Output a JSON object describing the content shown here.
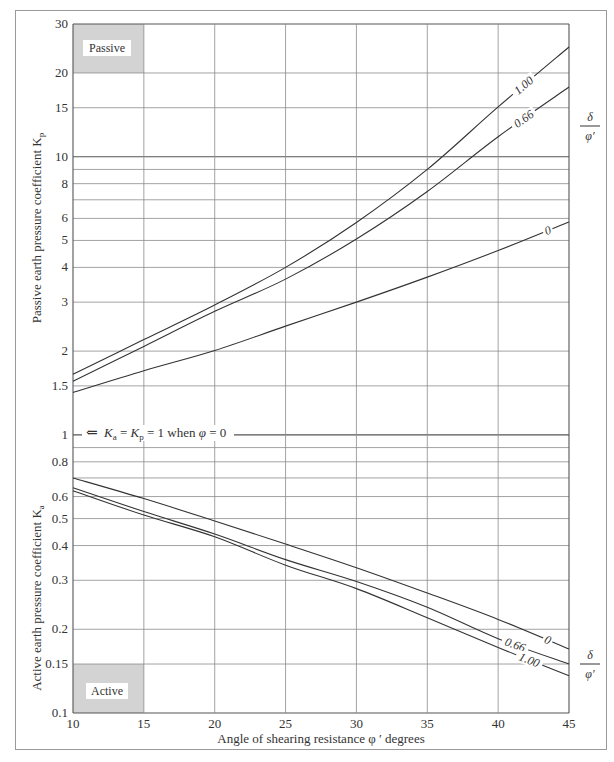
{
  "chart_data": {
    "type": "line",
    "title": "",
    "xlabel": "Angle of shearing resistance φ ′  degrees",
    "ylabel_passive": "Passive earth pressure coefficient K",
    "ylabel_passive_sub": "p",
    "ylabel_active": "Active earth pressure coefficient K",
    "ylabel_active_sub": "a",
    "x_scale": "linear",
    "y_scale": "log",
    "xlim": [
      10,
      45
    ],
    "ylim": [
      0.1,
      30
    ],
    "grid": true,
    "x_ticks": [
      10,
      15,
      20,
      25,
      30,
      35,
      40,
      45
    ],
    "y_gridlines": [
      30,
      20,
      15,
      10,
      9,
      8,
      7,
      6,
      5,
      4,
      3,
      2,
      1.5,
      1,
      0.9,
      0.8,
      0.7,
      0.6,
      0.5,
      0.4,
      0.3,
      0.2,
      0.15,
      0.1
    ],
    "y_tick_labels": [
      {
        "value": 30,
        "label": "30"
      },
      {
        "value": 20,
        "label": "20"
      },
      {
        "value": 15,
        "label": "15"
      },
      {
        "value": 10,
        "label": "10"
      },
      {
        "value": 8,
        "label": "8"
      },
      {
        "value": 6,
        "label": "6"
      },
      {
        "value": 5,
        "label": "5"
      },
      {
        "value": 4,
        "label": "4"
      },
      {
        "value": 3,
        "label": "3"
      },
      {
        "value": 2,
        "label": "2"
      },
      {
        "value": 1.5,
        "label": "1.5"
      },
      {
        "value": 1,
        "label": "1"
      },
      {
        "value": 0.8,
        "label": "0.8"
      },
      {
        "value": 0.6,
        "label": "0.6"
      },
      {
        "value": 0.5,
        "label": "0.5"
      },
      {
        "value": 0.4,
        "label": "0.4"
      },
      {
        "value": 0.3,
        "label": "0.3"
      },
      {
        "value": 0.2,
        "label": "0.2"
      },
      {
        "value": 0.15,
        "label": "0.15"
      },
      {
        "value": 0.1,
        "label": "0.1"
      }
    ],
    "x": [
      10,
      15,
      20,
      25,
      30,
      35,
      40,
      45
    ],
    "legend_title_num": "δ",
    "legend_title_den": "φ′",
    "series": [
      {
        "name": "Passive δ/φ′ = 1.00",
        "group": "passive",
        "label": "1.00",
        "values": [
          1.65,
          2.2,
          2.93,
          4.0,
          5.8,
          9.0,
          15.1,
          24.8
        ]
      },
      {
        "name": "Passive δ/φ′ = 0.66",
        "group": "passive",
        "label": "0.66",
        "values": [
          1.56,
          2.08,
          2.78,
          3.63,
          5.06,
          7.5,
          11.8,
          17.8
        ]
      },
      {
        "name": "Passive δ/φ′ = 0",
        "group": "passive",
        "label": "0",
        "values": [
          1.42,
          1.7,
          2.01,
          2.46,
          3.0,
          3.69,
          4.6,
          5.83
        ]
      },
      {
        "name": "Active δ/φ′ = 0",
        "group": "active",
        "label": "0",
        "values": [
          0.7,
          0.59,
          0.49,
          0.405,
          0.333,
          0.27,
          0.217,
          0.17
        ]
      },
      {
        "name": "Active δ/φ′ = 0.66",
        "group": "active",
        "label": "0.66",
        "values": [
          0.645,
          0.53,
          0.44,
          0.356,
          0.297,
          0.24,
          0.185,
          0.15
        ]
      },
      {
        "name": "Active δ/φ′ = 1.00",
        "group": "active",
        "label": "1.00",
        "values": [
          0.63,
          0.515,
          0.43,
          0.34,
          0.28,
          0.22,
          0.172,
          0.136
        ]
      }
    ],
    "annotations": [
      {
        "text_prefix": "⇐ ",
        "text": "Kₐ = Kₚ = 1  when φ = 0",
        "at_y": 1,
        "x_from": 10,
        "x_to": 28
      }
    ],
    "regions": [
      {
        "label": "Passive",
        "x": [
          10,
          15
        ],
        "y": [
          20,
          30
        ],
        "fill": "#d3d3d3"
      },
      {
        "label": "Active",
        "x": [
          10,
          15
        ],
        "y": [
          0.1,
          0.15
        ],
        "fill": "#d3d3d3"
      }
    ]
  },
  "ui": {
    "passive_region_label": "Passive",
    "active_region_label": "Active",
    "x_axis_title": "Angle of shearing resistance φ ′  degrees",
    "passive_axis_title": "Passive earth pressure coefficient K",
    "passive_axis_sub": "p",
    "active_axis_title": "Active earth pressure coefficient K",
    "active_axis_sub": "a",
    "annotation_parts": {
      "arrow": "⇐",
      "k1": "K",
      "k1_sub": "a",
      "eq1": " = ",
      "k2": "K",
      "k2_sub": "p",
      "rest": " = 1  when ",
      "phi": "φ",
      "tail": " = 0"
    }
  },
  "colors": {
    "grid": "#8c8c8c",
    "grid_major": "#555555",
    "curve": "#333333",
    "region_fill": "#d3d3d3",
    "frame": "#9a9a9a"
  }
}
